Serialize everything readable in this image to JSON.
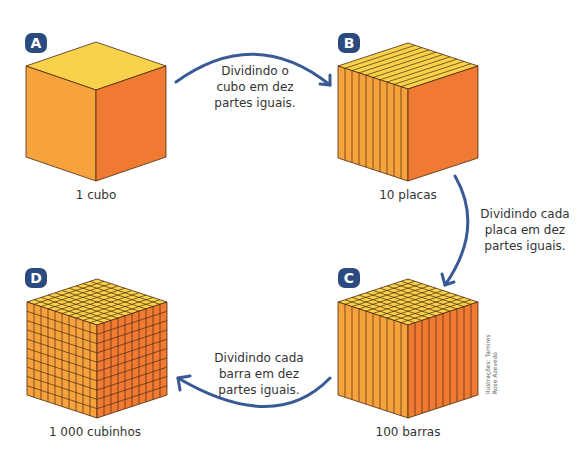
{
  "colors": {
    "top": "#f7d24a",
    "left": "#f7a33d",
    "right": "#f07a32",
    "edge": "#4a2a10",
    "badge": "#2b4a80",
    "arrow": "#3a5a96"
  },
  "panels": [
    {
      "id": "A",
      "badge": "A",
      "caption": "1 cubo",
      "divisions": "none"
    },
    {
      "id": "B",
      "badge": "B",
      "caption": "10 placas",
      "divisions": "plates"
    },
    {
      "id": "C",
      "badge": "C",
      "caption": "100 barras",
      "divisions": "bars"
    },
    {
      "id": "D",
      "badge": "D",
      "caption": "1 000 cubinhos",
      "divisions": "cubes"
    }
  ],
  "arrows": [
    {
      "from": "A",
      "to": "B",
      "lines": [
        "Dividindo o",
        "cubo em dez",
        "partes iguais."
      ]
    },
    {
      "from": "B",
      "to": "C",
      "lines": [
        "Dividindo cada",
        "placa em dez",
        "partes iguais."
      ]
    },
    {
      "from": "C",
      "to": "D",
      "lines": [
        "Dividindo cada",
        "barra em dez",
        "partes iguais."
      ]
    }
  ],
  "credit": {
    "line1": "Ilustrações: Tamires",
    "line2": "Rose Azevedo"
  }
}
